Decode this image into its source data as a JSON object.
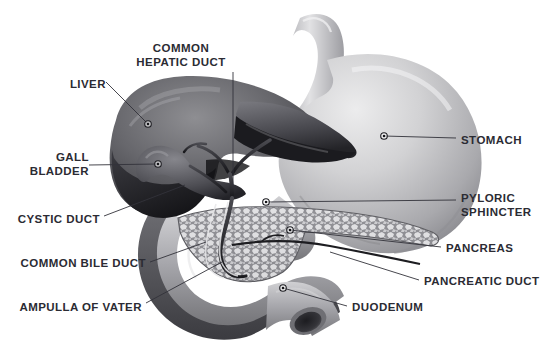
{
  "figure": {
    "background_color": "#ffffff",
    "text_color": "#2b2b33",
    "leader_color": "#32323a",
    "style": "grayscale medical illustration"
  },
  "labels": [
    {
      "id": "liver",
      "text": "LIVER",
      "align": "right",
      "x": 106,
      "y": 78,
      "lines": [
        "LIVER"
      ],
      "marker": {
        "x": 148,
        "y": 124
      },
      "leader": "M106,82 L148,124"
    },
    {
      "id": "common-hepatic-duct",
      "text": "COMMON\nHEPATIC DUCT",
      "align": "center",
      "x": 181,
      "y": 42,
      "lines": [
        "COMMON",
        "HEPATIC DUCT"
      ],
      "marker": null,
      "leader": "M233,72 L233,188"
    },
    {
      "id": "gall-bladder",
      "text": "GALL\nBLADDER",
      "align": "right",
      "x": 89,
      "y": 151,
      "lines": [
        "GALL",
        "BLADDER"
      ],
      "marker": {
        "x": 158,
        "y": 164
      },
      "leader": "M89,165 L158,164"
    },
    {
      "id": "cystic-duct",
      "text": "CYSTIC DUCT",
      "align": "right",
      "x": 100,
      "y": 213,
      "lines": [
        "CYSTIC DUCT"
      ],
      "marker": null,
      "leader": "M104,216 L185,185"
    },
    {
      "id": "common-bile-duct",
      "text": "COMMON BILE DUCT",
      "align": "right",
      "x": 146,
      "y": 257,
      "lines": [
        "COMMON BILE DUCT"
      ],
      "marker": null,
      "leader": "M150,262 L206,242"
    },
    {
      "id": "ampulla-of-vater",
      "text": "AMPULLA OF VATER",
      "align": "right",
      "x": 142,
      "y": 301,
      "lines": [
        "AMPULLA OF VATER"
      ],
      "marker": null,
      "leader": "M146,303 L222,262"
    },
    {
      "id": "stomach",
      "text": "STOMACH",
      "align": "left",
      "x": 461,
      "y": 134,
      "lines": [
        "STOMACH"
      ],
      "marker": {
        "x": 384,
        "y": 136
      },
      "leader": "M384,136 L456,138"
    },
    {
      "id": "pyloric-sphincter",
      "text": "PYLORIC\nSPHINCTER",
      "align": "left",
      "x": 461,
      "y": 192,
      "lines": [
        "PYLORIC",
        "SPHINCTER"
      ],
      "marker": {
        "x": 266,
        "y": 202
      },
      "leader": "M266,202 L456,200"
    },
    {
      "id": "pancreas",
      "text": "PANCREAS",
      "align": "left",
      "x": 446,
      "y": 242,
      "lines": [
        "PANCREAS"
      ],
      "marker": {
        "x": 290,
        "y": 230
      },
      "leader": "M290,230 L441,247"
    },
    {
      "id": "pancreatic-duct",
      "text": "PANCREATIC DUCT",
      "align": "left",
      "x": 424,
      "y": 275,
      "lines": [
        "PANCREATIC DUCT"
      ],
      "marker": null,
      "leader": "M330,252 L419,280"
    },
    {
      "id": "duodenum",
      "text": "DUODENUM",
      "align": "left",
      "x": 352,
      "y": 301,
      "lines": [
        "DUODENUM"
      ],
      "marker": {
        "x": 283,
        "y": 288
      },
      "leader": "M283,288 L347,306"
    }
  ],
  "organs": [
    {
      "id": "liver",
      "name": "Liver",
      "tone": "dark gray lobed mass"
    },
    {
      "id": "gallbladder",
      "name": "Gall bladder",
      "tone": "medium gray pear shape"
    },
    {
      "id": "stomach",
      "name": "Stomach",
      "tone": "light gray curved sac"
    },
    {
      "id": "esophagus",
      "name": "Esophagus",
      "tone": "light gray tube"
    },
    {
      "id": "pancreas",
      "name": "Pancreas",
      "tone": "mottled gray lobular gland"
    },
    {
      "id": "duodenum",
      "name": "Duodenum",
      "tone": "medium gray C-loop tube"
    },
    {
      "id": "biliary-tree",
      "name": "Biliary ducts",
      "tone": "dark thin branching tubes"
    }
  ]
}
